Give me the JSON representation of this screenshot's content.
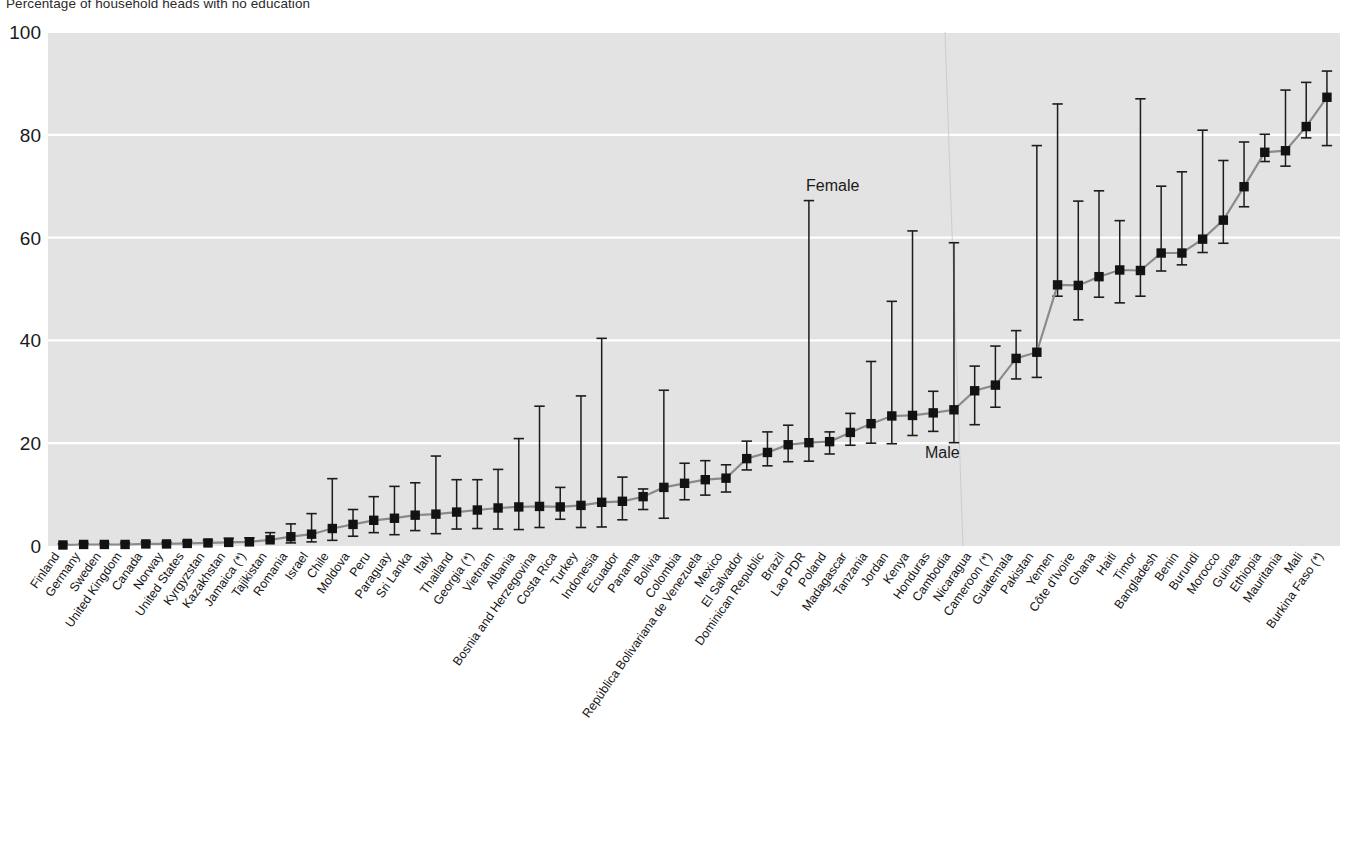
{
  "title": "Percentage of household heads with no education",
  "annotations": {
    "female_label": "Female",
    "male_label": "Male"
  },
  "axis": {
    "y_ticks": [
      "0",
      "20",
      "40",
      "60",
      "80",
      "100"
    ],
    "y_min": 0,
    "y_max": 100
  },
  "colors": {
    "plot_background": "#e3e3e3",
    "gridline": "#ffffff",
    "marker": "#121212",
    "error_bar": "#1c1c1c",
    "connector": "#8a8a8a",
    "page_background": "#ffffff",
    "text": "#141414"
  },
  "chart_data": {
    "type": "scatter",
    "title": "Percentage of household heads with no education",
    "xlabel": "",
    "ylabel": "",
    "ylim": [
      0,
      100
    ],
    "grid": true,
    "legend_position": "inline-annotation",
    "series": [
      {
        "name": "Male",
        "role": "marker"
      },
      {
        "name": "Female",
        "role": "error-bar-upper"
      }
    ],
    "categories": [
      "Finland",
      "Germany",
      "Sweden",
      "United Kingdom",
      "Canada",
      "Norway",
      "United States",
      "Kyrgyzstan",
      "Kazakhstan",
      "Jamaica (*)",
      "Tajikistan",
      "Romania",
      "Israel",
      "Chile",
      "Moldova",
      "Peru",
      "Paraguay",
      "Sri Lanka",
      "Italy",
      "Thailand",
      "Georgia (*)",
      "Vietnam",
      "Albania",
      "Bosnia and Herzegovina",
      "Costa Rica",
      "Turkey",
      "Indonesia",
      "Ecuador",
      "Panama",
      "Bolivia",
      "Colombia",
      "República Bolivariana de Venezuela",
      "Mexico",
      "El Salvador",
      "Dominican Republic",
      "Brazil",
      "Lao PDR",
      "Poland",
      "Madagascar",
      "Tanzania",
      "Jordan",
      "Kenya",
      "Honduras",
      "Cambodia",
      "Nicaragua",
      "Cameroon (*)",
      "Guatemala",
      "Pakistan",
      "Yemen",
      "Côte d'Ivoire",
      "Ghana",
      "Haiti",
      "Timor",
      "Bangladesh",
      "Benin",
      "Burundi",
      "Morocco",
      "Guinea",
      "Ethiopia",
      "Mauritania",
      "Mali",
      "Burkina Faso (*)"
    ],
    "male": [
      0.2,
      0.3,
      0.3,
      0.3,
      0.4,
      0.4,
      0.5,
      0.6,
      0.7,
      0.8,
      1.2,
      1.8,
      2.3,
      3.4,
      4.2,
      5.0,
      5.4,
      6.0,
      6.2,
      6.6,
      7.0,
      7.4,
      7.6,
      7.7,
      7.6,
      7.9,
      8.5,
      8.7,
      9.6,
      11.4,
      12.2,
      12.9,
      13.2,
      17.0,
      18.2,
      19.7,
      20.1,
      20.3,
      22.1,
      23.8,
      25.3,
      25.4,
      25.9,
      26.5,
      30.2,
      31.3,
      36.5,
      37.7,
      50.8,
      50.7,
      52.4,
      53.7,
      53.6,
      57.0,
      57.0,
      59.7,
      63.4,
      69.9,
      76.6,
      76.9,
      81.6,
      87.3
    ],
    "female_upper": [
      0.4,
      0.5,
      0.5,
      0.6,
      0.8,
      0.7,
      0.9,
      1.1,
      1.5,
      1.6,
      2.6,
      4.3,
      6.3,
      13.1,
      7.1,
      9.6,
      11.6,
      12.3,
      17.5,
      12.9,
      12.9,
      14.9,
      20.9,
      27.2,
      11.4,
      29.2,
      40.4,
      13.4,
      11.1,
      30.3,
      16.1,
      16.6,
      15.8,
      20.4,
      22.2,
      23.5,
      67.2,
      22.2,
      25.8,
      35.9,
      47.6,
      61.3,
      30.1,
      59.0,
      35.0,
      38.9,
      41.9,
      77.9,
      86.0,
      67.1,
      69.1,
      63.3,
      87.0,
      70.0,
      72.8,
      80.9,
      75.0,
      78.6,
      80.1,
      88.7,
      90.2,
      92.4,
      87.6
    ],
    "male_lower": [
      0.05,
      0.1,
      0.1,
      0.1,
      0.1,
      0.1,
      0.2,
      0.2,
      0.2,
      0.2,
      0.4,
      0.6,
      0.8,
      1.1,
      1.9,
      2.6,
      2.2,
      3.0,
      2.4,
      3.3,
      3.4,
      3.3,
      3.2,
      3.6,
      5.2,
      3.6,
      3.7,
      5.1,
      7.1,
      5.4,
      9.0,
      9.9,
      10.5,
      14.8,
      15.6,
      16.4,
      16.5,
      17.9,
      19.6,
      20.0,
      19.9,
      21.5,
      22.3,
      20.1,
      23.6,
      27.0,
      32.5,
      32.8,
      48.6,
      44.0,
      48.4,
      47.3,
      48.6,
      53.5,
      54.7,
      57.1,
      58.9,
      66.0,
      74.8,
      73.9,
      79.4,
      77.9
    ]
  }
}
